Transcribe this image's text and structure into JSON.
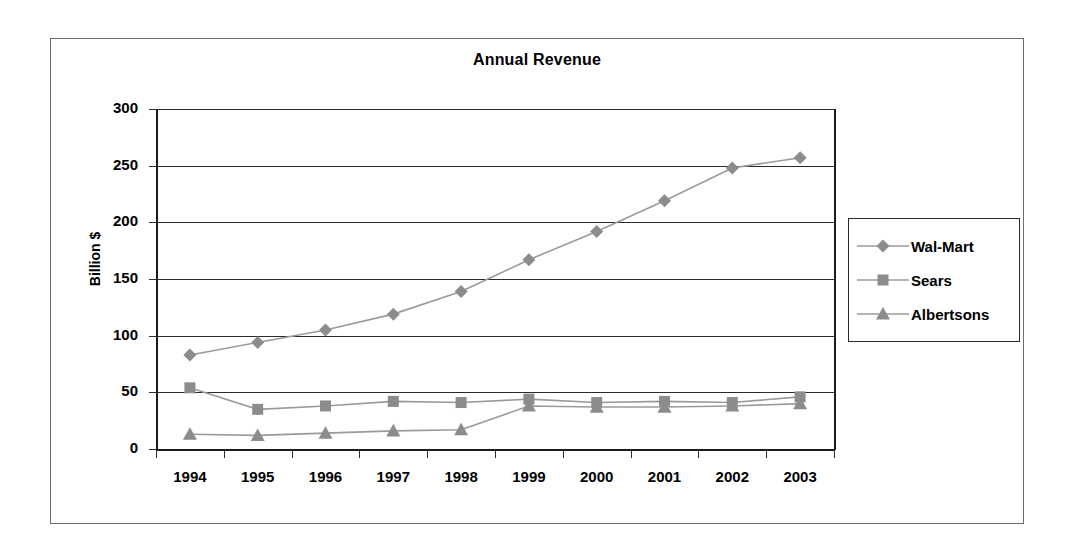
{
  "chart_data": {
    "type": "line",
    "title": "Annual Revenue",
    "xlabel": "",
    "ylabel": "Billion $",
    "categories": [
      "1994",
      "1995",
      "1996",
      "1997",
      "1998",
      "1999",
      "2000",
      "2001",
      "2002",
      "2003"
    ],
    "yticks": [
      0,
      50,
      100,
      150,
      200,
      250,
      300
    ],
    "ylim": [
      0,
      300
    ],
    "grid": true,
    "legend_position": "right",
    "series": [
      {
        "name": "Wal-Mart",
        "marker": "diamond",
        "color": "#8c8c8c",
        "values": [
          83,
          94,
          105,
          119,
          139,
          167,
          192,
          219,
          248,
          257
        ]
      },
      {
        "name": "Sears",
        "marker": "square",
        "color": "#8c8c8c",
        "values": [
          54,
          35,
          38,
          42,
          41,
          44,
          41,
          42,
          41,
          46
        ]
      },
      {
        "name": "Albertsons",
        "marker": "triangle",
        "color": "#8c8c8c",
        "values": [
          13,
          12,
          14,
          16,
          17,
          38,
          37,
          37,
          38,
          40
        ]
      }
    ]
  },
  "legend": {
    "entries": [
      {
        "label": "Wal-Mart",
        "marker": "diamond"
      },
      {
        "label": "Sears",
        "marker": "square"
      },
      {
        "label": "Albertsons",
        "marker": "triangle"
      }
    ]
  },
  "colors": {
    "series": "#8c8c8c",
    "line": "#9a9a9a",
    "axis": "#1a1a1a",
    "grid": "#2b2b2b",
    "frame": "#6e6e6e",
    "text": "#000000",
    "background": "#ffffff"
  }
}
